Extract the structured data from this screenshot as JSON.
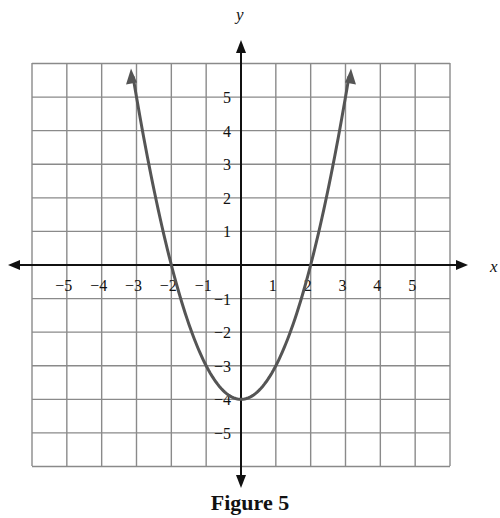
{
  "chart_data": {
    "type": "line",
    "title": "Figure 5",
    "xlabel": "x",
    "ylabel": "y",
    "xlim": [
      -6,
      6
    ],
    "ylim": [
      -6,
      6
    ],
    "grid": true,
    "x_tick_labels": [
      "−5",
      "−4",
      "−3",
      "−2",
      "−1",
      "1",
      "2",
      "3",
      "4",
      "5"
    ],
    "y_tick_labels": [
      "5",
      "4",
      "3",
      "2",
      "1",
      "−1",
      "−2",
      "−3",
      "−4",
      "−5"
    ],
    "series": [
      {
        "name": "y = x^2 - 4",
        "x": [
          -3.1,
          -3,
          -2.5,
          -2,
          -1.5,
          -1,
          -0.5,
          0,
          0.5,
          1,
          1.5,
          2,
          2.5,
          3,
          3.1
        ],
        "y": [
          5.61,
          5,
          2.25,
          0,
          -1.75,
          -3,
          -3.75,
          -4,
          -3.75,
          -3,
          -1.75,
          0,
          2.25,
          5,
          5.61
        ],
        "color": "#555555",
        "arrows_at_ends": true
      }
    ],
    "annotations": []
  },
  "caption": "Figure 5",
  "axis_labels": {
    "x": "x",
    "y": "y"
  },
  "colors": {
    "grid": "#8a8a8a",
    "axis": "#111111",
    "curve": "#555555"
  }
}
